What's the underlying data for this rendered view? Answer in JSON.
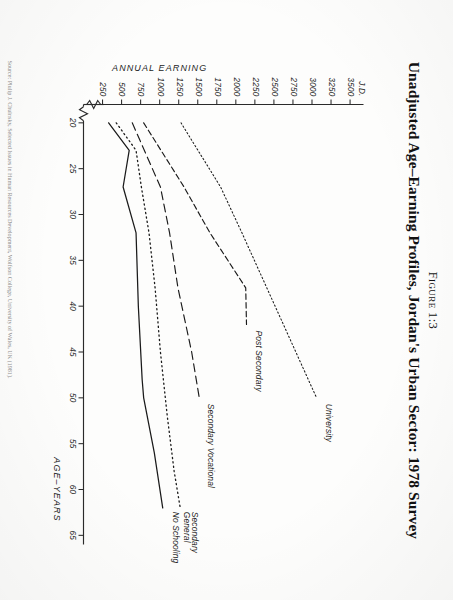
{
  "figure": {
    "label": "Figure 1:3",
    "title": "Unadjusted Age–Earning Profiles, Jordan's Urban Sector: 1978 Survey",
    "footnote": "Source: Plulip J. Chulnsky, Selected Issues in Human Resources Development, Wolfson College, University of Wales, UK (1981)."
  },
  "chart_data": {
    "type": "line",
    "title": "Unadjusted Age–Earning Profiles, Jordan's Urban Sector: 1978 Survey",
    "xlabel": "AGE–YEARS",
    "ylabel": "ANNUAL EARNING",
    "y_unit": "J.D.",
    "xlim": [
      18,
      66
    ],
    "ylim": [
      0,
      3650
    ],
    "grid": false,
    "legend": "inline-end-labels",
    "axis_break": {
      "axis": "y",
      "at": 160,
      "symbol": "zigzag"
    },
    "xticks": [
      20,
      25,
      30,
      35,
      40,
      45,
      50,
      55,
      60,
      65
    ],
    "yticks": [
      250,
      500,
      750,
      1000,
      1250,
      1500,
      1750,
      2000,
      2250,
      2500,
      2750,
      3000,
      3250,
      3500
    ],
    "ytick_labels": [
      "250",
      "500",
      "750",
      "1000",
      "1250",
      "1500",
      "1750",
      "2000",
      "2250",
      "2500",
      "2750",
      "3000",
      "3250",
      "3500"
    ],
    "ytick_prefix_label": "J.D.",
    "series": [
      {
        "name": "University",
        "style": "dotted",
        "stroke": "#1a1a1a",
        "x": [
          20,
          27,
          32,
          50
        ],
        "y": [
          1280,
          1800,
          2080,
          3060
        ]
      },
      {
        "name": "Post Secondary",
        "style": "dashed",
        "stroke": "#1a1a1a",
        "x": [
          20,
          27,
          32,
          38,
          42
        ],
        "y": [
          790,
          1320,
          1660,
          2130,
          2140
        ]
      },
      {
        "name": "Secondary Vocational",
        "style": "long-dash",
        "stroke": "#1a1a1a",
        "x": [
          20,
          27,
          32,
          38,
          45,
          50
        ],
        "y": [
          640,
          1010,
          1130,
          1240,
          1420,
          1520
        ]
      },
      {
        "name": "Secondary General",
        "style": "fine-dotted",
        "stroke": "#1a1a1a",
        "x": [
          20,
          23,
          27,
          32,
          38,
          45,
          52,
          58,
          62
        ],
        "y": [
          430,
          690,
          760,
          860,
          940,
          1010,
          1100,
          1190,
          1270
        ]
      },
      {
        "name": "No Schooling",
        "style": "solid",
        "stroke": "#1a1a1a",
        "x": [
          20,
          23,
          27,
          32,
          40,
          48,
          50,
          56,
          62
        ],
        "y": [
          330,
          600,
          520,
          690,
          720,
          770,
          790,
          930,
          1040
        ]
      }
    ]
  }
}
